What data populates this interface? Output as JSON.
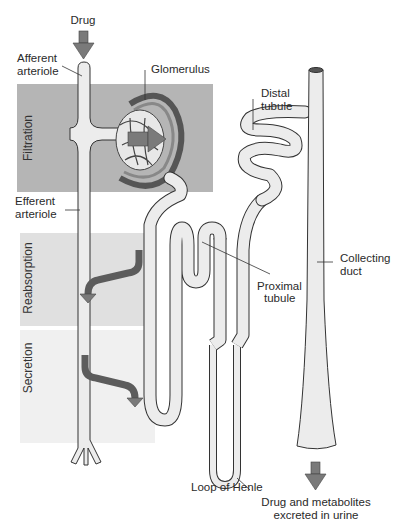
{
  "diagram": {
    "colors": {
      "filtration_panel": "#b5b5b5",
      "reabsorption_panel": "#e0e0e0",
      "secretion_panel": "#f0f0f0",
      "tubule_fill": "#ececec",
      "tubule_outline": "#333333",
      "arrow": "#7a7a7a",
      "arrow_dark": "#5c5c5c"
    },
    "process_panels": [
      {
        "label": "Filtration"
      },
      {
        "label": "Reabsorption"
      },
      {
        "label": "Secretion"
      }
    ],
    "labels": {
      "drug": "Drug",
      "afferent_line1": "Afferent",
      "afferent_line2": "arteriole",
      "glomerulus": "Glomerulus",
      "efferent_line1": "Efferent",
      "efferent_line2": "arteriole",
      "distal_line1": "Distal",
      "distal_line2": "tubule",
      "proximal_line1": "Proximal",
      "proximal_line2": "tubule",
      "collecting_line1": "Collecting",
      "collecting_line2": "duct",
      "loop_of_henle": "Loop of Henle",
      "output_line1": "Drug and metabolites",
      "output_line2": "excreted in urine"
    }
  }
}
